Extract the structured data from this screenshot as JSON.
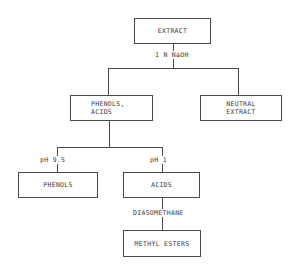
{
  "diagram": {
    "nodes": {
      "extract": "EXTRACT",
      "phenols_acids": "PHENOLS,\nACIDS",
      "neutral_extract": "NEUTRAL\nEXTRACT",
      "phenols": "PHENOLS",
      "acids": "ACIDS",
      "methyl_esters": "METHYL ESTERS"
    },
    "edge_labels": {
      "naoh": "1 N NaOH",
      "ph_9_5": "pH 9.5",
      "ph_1": "pH 1",
      "diasomethane": "DIASOMETHANE"
    },
    "colors": {
      "line": "#4a4a4a",
      "text": "#3a3a3a",
      "background": "#ffffff"
    }
  }
}
